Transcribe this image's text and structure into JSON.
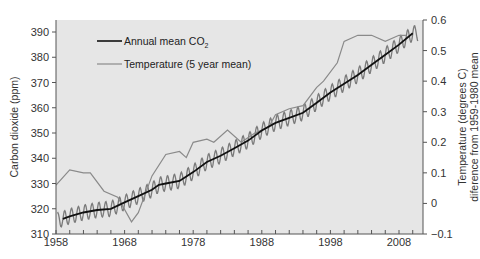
{
  "chart_data": {
    "type": "line",
    "title": "",
    "xlabel": "",
    "ylabel": "Carbon dioxide (ppm)",
    "y2label": [
      "Temperature (degrees C)",
      "diference from 1959-1980 mean"
    ],
    "xlim": [
      1958,
      2011.5
    ],
    "ylim": [
      310,
      394
    ],
    "y2lim": [
      -0.1,
      0.6
    ],
    "x_ticks": [
      1958,
      1968,
      1978,
      1988,
      1998,
      2008
    ],
    "y_ticks": [
      310,
      320,
      330,
      340,
      350,
      360,
      370,
      380,
      390
    ],
    "y2_ticks": [
      -0.1,
      0,
      0.1,
      0.2,
      0.3,
      0.4,
      0.5,
      0.6
    ],
    "y2_tick_labels": [
      "−0.1",
      "0",
      "0.1",
      "0.2",
      "0.3",
      "0.4",
      "0.5",
      "0.6"
    ],
    "grid": false,
    "background": "#e6e6e6",
    "legend_position": "upper-left",
    "legend": [
      {
        "label": "Annual mean CO",
        "subscript": "2",
        "color": "#111111"
      },
      {
        "label": "Temperature (5 year mean)",
        "color": "#8a8a8a"
      }
    ],
    "series": [
      {
        "name": "Annual mean CO2",
        "axis": "left",
        "color": "#111111",
        "x": [
          1959,
          1960,
          1962,
          1964,
          1966,
          1968,
          1970,
          1972,
          1973,
          1974,
          1976,
          1978,
          1980,
          1982,
          1984,
          1986,
          1988,
          1990,
          1992,
          1994,
          1996,
          1998,
          2000,
          2002,
          2004,
          2006,
          2008,
          2010
        ],
        "values": [
          316,
          317,
          318.5,
          319.5,
          320,
          322.5,
          325,
          327.5,
          329.5,
          330,
          331,
          334.5,
          338.5,
          341,
          344,
          347,
          351,
          354,
          356,
          358,
          362,
          366,
          369.5,
          373,
          377,
          381,
          385,
          389.5
        ]
      },
      {
        "name": "Monthly CO2 (seasonal cycle)",
        "axis": "left",
        "color": "#7a7a7a",
        "seasonal_amplitude_ppm": 3
      },
      {
        "name": "Temperature (5 year mean)",
        "axis": "right",
        "color": "#8a8a8a",
        "x": [
          1958,
          1960,
          1962,
          1963,
          1965,
          1967,
          1969,
          1970,
          1972,
          1974,
          1976,
          1977,
          1978,
          1980,
          1981,
          1983,
          1985,
          1987,
          1989,
          1990,
          1992,
          1994,
          1996,
          1997,
          1999,
          2000,
          2002,
          2004,
          2006,
          2008,
          2009
        ],
        "values": [
          0.06,
          0.11,
          0.1,
          0.1,
          0.04,
          0.02,
          -0.06,
          -0.03,
          0.09,
          0.16,
          0.17,
          0.15,
          0.2,
          0.21,
          0.2,
          0.24,
          0.2,
          0.23,
          0.25,
          0.29,
          0.31,
          0.32,
          0.38,
          0.4,
          0.46,
          0.53,
          0.55,
          0.55,
          0.53,
          0.55,
          0.55
        ]
      }
    ]
  }
}
